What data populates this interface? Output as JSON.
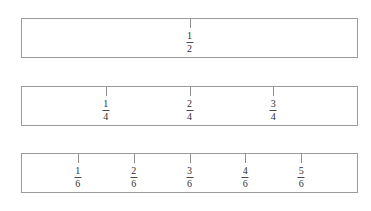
{
  "diagram": {
    "background_color": "#ffffff",
    "bar_border_color": "#9b9b9b",
    "tick_color": "#8d8d8d",
    "label_color": "#2e2e2e"
  },
  "chart_data": {
    "type": "bar",
    "subtitle": "",
    "xlabel": "",
    "ylabel": "",
    "grid": false,
    "legend": "none",
    "xlim": [
      0,
      1
    ],
    "categories": [
      "halves",
      "fourths",
      "sixths"
    ],
    "values": [
      2,
      4,
      6
    ],
    "series": [
      {
        "name": "halves",
        "denominator": 2,
        "divisions": 2,
        "tick_fractions": [
          0.5
        ],
        "labels": [
          {
            "numerator": "1",
            "denominator": "2",
            "position": 0.5
          }
        ]
      },
      {
        "name": "fourths",
        "denominator": 4,
        "divisions": 4,
        "tick_fractions": [
          0.25,
          0.5,
          0.75
        ],
        "labels": [
          {
            "numerator": "1",
            "denominator": "4",
            "position": 0.25
          },
          {
            "numerator": "2",
            "denominator": "4",
            "position": 0.5
          },
          {
            "numerator": "3",
            "denominator": "4",
            "position": 0.75
          }
        ]
      },
      {
        "name": "sixths",
        "denominator": 6,
        "divisions": 6,
        "tick_fractions": [
          0.1667,
          0.3333,
          0.5,
          0.6667,
          0.8333
        ],
        "labels": [
          {
            "numerator": "1",
            "denominator": "6",
            "position": 0.1667
          },
          {
            "numerator": "2",
            "denominator": "6",
            "position": 0.3333
          },
          {
            "numerator": "3",
            "denominator": "6",
            "position": 0.5
          },
          {
            "numerator": "4",
            "denominator": "6",
            "position": 0.6667
          },
          {
            "numerator": "5",
            "denominator": "6",
            "position": 0.8333
          }
        ]
      }
    ]
  }
}
